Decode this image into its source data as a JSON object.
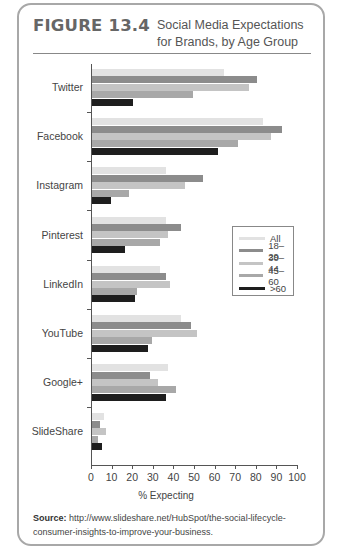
{
  "figure": {
    "number": "FIGURE 13.4",
    "title_line1": "Social Media Expectations",
    "title_line2": "for Brands, by Age Group"
  },
  "source": {
    "label": "Source:",
    "text": "http://www.slideshare.net/HubSpot/the-social-lifecycle-consumer-insights-to-improve-your-business."
  },
  "colors": {
    "All": "#e2e2e2",
    "18-29": "#8c8c8c",
    "30-44": "#c4c4c4",
    "45-60": "#a8a8a8",
    ">60": "#1e1e1e"
  },
  "chart_data": {
    "type": "bar",
    "orientation": "horizontal",
    "title": "Social Media Expectations for Brands, by Age Group",
    "xlabel": "% Expecting",
    "ylabel": "",
    "xlim": [
      0,
      100
    ],
    "xticks": [
      0,
      10,
      20,
      30,
      40,
      50,
      60,
      70,
      80,
      90,
      100
    ],
    "grid": false,
    "legend_position": "right-center (inside plot)",
    "categories": [
      "Twitter",
      "Facebook",
      "Instagram",
      "Pinterest",
      "LinkedIn",
      "YouTube",
      "Google+",
      "SlideShare"
    ],
    "series": [
      {
        "name": "All",
        "values": [
          64,
          83,
          36,
          36,
          33,
          43,
          37,
          6
        ]
      },
      {
        "name": "18–29",
        "values": [
          80,
          92,
          54,
          43,
          36,
          48,
          28,
          4
        ]
      },
      {
        "name": "30–44",
        "values": [
          76,
          87,
          45,
          37,
          38,
          51,
          32,
          7
        ]
      },
      {
        "name": "45–60",
        "values": [
          49,
          71,
          18,
          33,
          22,
          29,
          41,
          3
        ]
      },
      {
        "name": ">60",
        "values": [
          20,
          61,
          9,
          16,
          21,
          27,
          36,
          5
        ]
      }
    ]
  },
  "legend": [
    {
      "label": "All"
    },
    {
      "label": "18–29"
    },
    {
      "label": "30–44"
    },
    {
      "label": "45–60"
    },
    {
      "label": ">60"
    }
  ]
}
